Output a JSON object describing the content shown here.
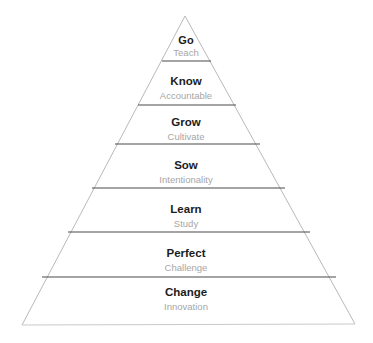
{
  "diagram": {
    "name": "growth-pyramid",
    "type": "pyramid",
    "background_color": "#ffffff",
    "title_color": "#1c1c1c",
    "subtitle_color": "#a6a6a6",
    "edge_color": "#b9b9b9",
    "divider_color": "#4a4a4a",
    "tiers": [
      {
        "title": "Go",
        "subtitle": "Teach"
      },
      {
        "title": "Know",
        "subtitle": "Accountable"
      },
      {
        "title": "Grow",
        "subtitle": "Cultivate"
      },
      {
        "title": "Sow",
        "subtitle": "Intentionality"
      },
      {
        "title": "Learn",
        "subtitle": "Study"
      },
      {
        "title": "Perfect",
        "subtitle": "Challenge"
      },
      {
        "title": "Change",
        "subtitle": "Innovation"
      }
    ]
  }
}
